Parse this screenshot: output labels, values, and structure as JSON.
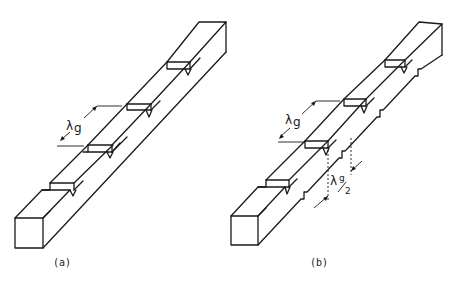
{
  "figure": {
    "panels": [
      {
        "id": "a",
        "caption": "(a)",
        "description": "Rectangular waveguide with periodic steps on the top wall (corrugated/ridged top)",
        "dimension_labels": [
          {
            "symbol": "λ",
            "subscript": "g",
            "meaning": "period equals guide wavelength"
          }
        ]
      },
      {
        "id": "b",
        "caption": "(b)",
        "description": "Rectangular waveguide with periodic steps on the top wall and staggered notches on the side wall",
        "dimension_labels": [
          {
            "symbol": "λ",
            "subscript": "g",
            "meaning": "period equals guide wavelength"
          },
          {
            "symbol": "λ",
            "subscript": "g",
            "fraction_denominator": "2",
            "meaning": "offset of half a guide wavelength"
          }
        ]
      }
    ]
  },
  "labels": {
    "a_caption": "(a)",
    "b_caption": "(b)",
    "lambda": "λ",
    "g": "g",
    "half": "2"
  },
  "colors": {
    "line": "#1a1a1a",
    "background": "#ffffff"
  }
}
